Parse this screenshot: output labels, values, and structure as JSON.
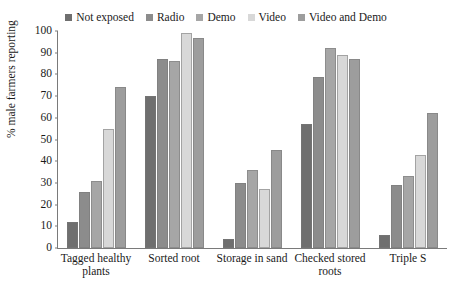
{
  "chart_data": {
    "type": "bar",
    "title": "",
    "xlabel": "",
    "ylabel": "% male farmers reporting",
    "ylim": [
      0,
      100
    ],
    "yticks": [
      0,
      10,
      20,
      30,
      40,
      50,
      60,
      70,
      80,
      90,
      100
    ],
    "grid": false,
    "legend_position": "top-center",
    "categories": [
      "Tagged healthy plants",
      "Sorted root",
      "Storage in sand",
      "Checked stored roots",
      "Triple S"
    ],
    "series": [
      {
        "name": "Not exposed",
        "color": "#6f6f6f",
        "values": [
          12,
          70,
          4,
          57,
          6
        ]
      },
      {
        "name": "Radio",
        "color": "#8c8c8c",
        "values": [
          26,
          87,
          30,
          79,
          29
        ]
      },
      {
        "name": "Demo",
        "color": "#a6a6a6",
        "values": [
          31,
          86,
          36,
          92,
          33
        ]
      },
      {
        "name": "Video",
        "color": "#d8d8d8",
        "values": [
          55,
          99,
          27,
          89,
          43
        ]
      },
      {
        "name": "Video and Demo",
        "color": "#9d9d9d",
        "values": [
          74,
          97,
          45,
          87,
          62
        ]
      }
    ]
  }
}
